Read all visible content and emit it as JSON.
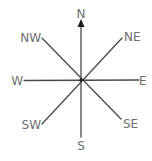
{
  "diagram": {
    "center": {
      "x": 81,
      "y": 80
    },
    "colors": {
      "line": "#4a4a4a",
      "label": "#6e6e6e",
      "arrow": "#1a1a1a"
    },
    "directions": {
      "n": "N",
      "ne": "NE",
      "e": "E",
      "se": "SE",
      "s": "S",
      "sw": "SW",
      "w": "W",
      "nw": "NW"
    }
  }
}
